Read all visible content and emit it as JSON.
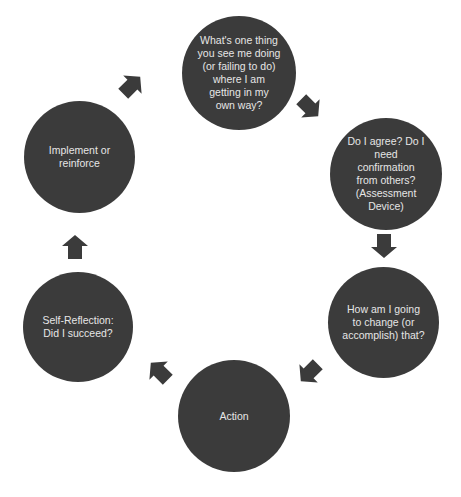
{
  "diagram": {
    "type": "cycle",
    "colors": {
      "node_fill": "#3b3b3b",
      "node_text": "#e6e6e6",
      "arrow_fill": "#3b3b3b",
      "background": "#ffffff"
    },
    "nodes": [
      {
        "id": "question",
        "label": "What's one thing\nyou see me doing\n(or failing to do)\nwhere I am\ngetting in my\nown way?"
      },
      {
        "id": "assess",
        "label": "Do I agree? Do I\nneed\nconfirmation\nfrom others?\n(Assessment\nDevice)"
      },
      {
        "id": "plan",
        "label": "How am I going\nto change (or\naccomplish) that?"
      },
      {
        "id": "action",
        "label": "Action"
      },
      {
        "id": "reflect",
        "label": "Self-Reflection:\nDid I succeed?"
      },
      {
        "id": "implement",
        "label": "Implement or\nreinforce"
      }
    ],
    "edges": [
      {
        "from": "question",
        "to": "assess"
      },
      {
        "from": "assess",
        "to": "plan"
      },
      {
        "from": "plan",
        "to": "action"
      },
      {
        "from": "action",
        "to": "reflect"
      },
      {
        "from": "reflect",
        "to": "implement"
      },
      {
        "from": "implement",
        "to": "question"
      }
    ]
  }
}
